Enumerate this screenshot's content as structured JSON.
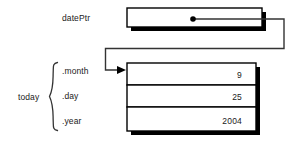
{
  "diagram": {
    "title_labels": {
      "pointer_label": "datePtr",
      "struct_label": "today"
    },
    "pointer_box": {
      "name": "datePtr",
      "contents": ""
    },
    "fields": [
      {
        "label": ".month",
        "value": "9"
      },
      {
        "label": ".day",
        "value": "25"
      },
      {
        "label": ".year",
        "value": "2004"
      }
    ],
    "colors": {
      "stroke": "#000000",
      "shadow": "#000000",
      "box_fill": "#ffffff",
      "text": "#1a1a1a",
      "connector": "#333333"
    }
  }
}
